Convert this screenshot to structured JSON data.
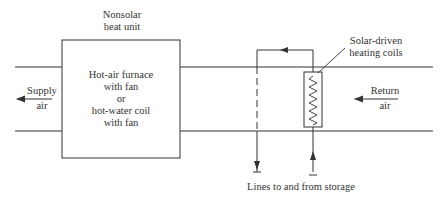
{
  "diagram": {
    "nonsolar_unit": {
      "title_line1": "Nonsolar",
      "title_line2": "heat unit",
      "body_line1": "Hot-air furnace",
      "body_line2": "with fan",
      "body_line3": "or",
      "body_line4": "hot-water coil",
      "body_line5": "with fan"
    },
    "supply": {
      "line1": "Supply",
      "line2": "air",
      "arrow_direction": "left"
    },
    "return": {
      "line1": "Return",
      "line2": "air",
      "arrow_direction": "left"
    },
    "solar_coils": {
      "line1": "Solar-driven",
      "line2": "heating coils"
    },
    "storage": {
      "label": "Lines to and from storage"
    },
    "colors": {
      "line": "#333333",
      "background": "#ffffff"
    }
  }
}
